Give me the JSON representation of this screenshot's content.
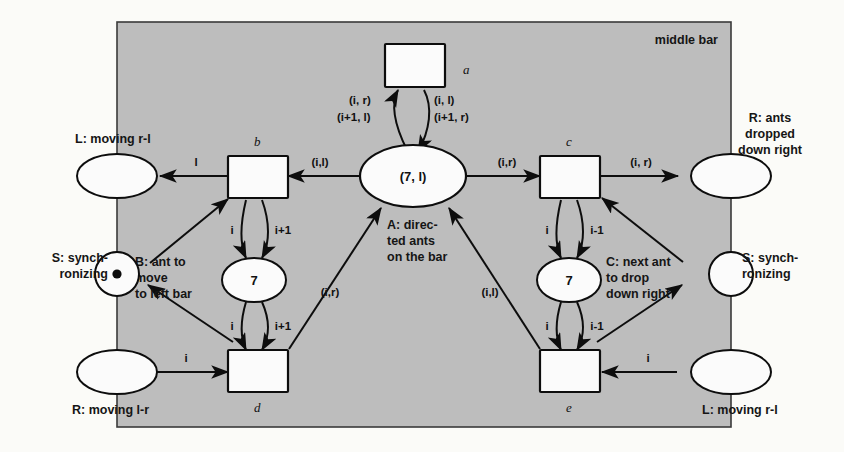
{
  "figure": {
    "type": "petri-net",
    "region_label": "middle bar"
  },
  "places": {
    "center": {
      "marking": "(7, l)",
      "label_lines": [
        "A: direc-",
        "ted ants",
        "on the  bar"
      ]
    },
    "left_counter": {
      "marking": "7",
      "label_lines": [
        "B: ant to",
        "move",
        "to left bar"
      ]
    },
    "right_counter": {
      "marking": "7",
      "label_lines": [
        "C: next ant",
        "to drop",
        "down right"
      ]
    },
    "top_left_out": {
      "label": "L: moving r-l"
    },
    "left_sync": {
      "label_lines": [
        "S: synch-",
        "ronizing"
      ],
      "tokens": 1
    },
    "bottom_left_in": {
      "label": "R: moving l-r"
    },
    "top_right_out": {
      "label_lines": [
        "R: ants",
        "dropped",
        "down right"
      ]
    },
    "right_sync": {
      "label_lines": [
        "S: synch-",
        "ronizing"
      ],
      "tokens": 0
    },
    "bottom_right_in": {
      "label": "L: moving r-l"
    }
  },
  "transitions": {
    "a": {
      "name": "a"
    },
    "b": {
      "name": "b"
    },
    "c": {
      "name": "c"
    },
    "d": {
      "name": "d"
    },
    "e": {
      "name": "e"
    }
  },
  "arc_labels": {
    "a_to_center_left": "(i, r)",
    "a_to_center_left2": "(i+1, l)",
    "center_to_a_right": "(i, l)",
    "center_to_a_right2": "(i+1, r)",
    "center_to_b": "(i,l)",
    "center_to_c": "(i,r)",
    "b_to_left_out": "l",
    "c_to_right_out": "(i, r)",
    "b_counter_up": "i",
    "b_counter_down": "i+1",
    "d_counter_up": "i",
    "d_counter_down": "i+1",
    "c_counter_up": "i",
    "c_counter_down": "i-1",
    "e_counter_up": "i",
    "e_counter_down": "i-1",
    "d_to_center": "(i,r)",
    "e_to_center": "(i,l)",
    "in_left_to_d": "i",
    "in_right_to_e": "i"
  },
  "colors": {
    "region_fill": "#bdbdbd",
    "node_fill": "#fbfbfb",
    "stroke": "#0d0d0d",
    "page": "#fbfbf8"
  }
}
